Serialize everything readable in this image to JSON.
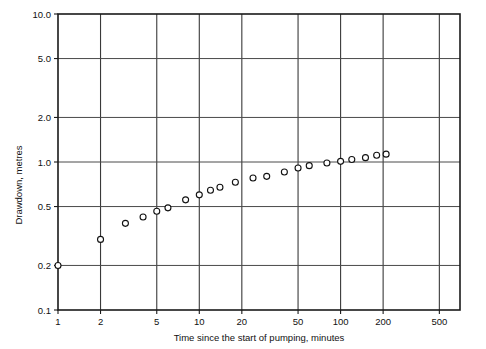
{
  "chart_data": {
    "type": "scatter",
    "title": "",
    "xlabel": "Time since the start of pumping, minutes",
    "ylabel": "Drawdown, metres",
    "xscale": "log",
    "yscale": "log",
    "xlim": [
      1,
      700
    ],
    "ylim": [
      0.1,
      10.0
    ],
    "grid": true,
    "legend": null,
    "xticks": [
      1,
      2,
      5,
      10,
      20,
      50,
      100,
      200,
      500
    ],
    "xtick_labels": [
      "1",
      "2",
      "5",
      "10",
      "20",
      "50",
      "100",
      "200",
      "500"
    ],
    "yticks": [
      0.1,
      0.2,
      0.5,
      1.0,
      2.0,
      5.0,
      10.0
    ],
    "ytick_labels": [
      "0.1",
      "0.5",
      "1.0",
      "2.0",
      "5.0",
      "0.2",
      "10.0"
    ],
    "ytick_labels_ordered": [
      "10.0",
      "5.0",
      "2.0",
      "1.0",
      "0.5",
      "0.2",
      "0.1"
    ],
    "series": [
      {
        "name": "Drawdown observations",
        "marker": "open-circle",
        "x": [
          1.0,
          2.0,
          3.0,
          4.0,
          5.0,
          6.0,
          8.0,
          10.0,
          12.0,
          14.0,
          18.0,
          24.0,
          30.0,
          40.0,
          50.0,
          60.0,
          80.0,
          100.0,
          120.0,
          150.0,
          180.0,
          210.0
        ],
        "y": [
          0.2,
          0.3,
          0.385,
          0.425,
          0.465,
          0.49,
          0.555,
          0.6,
          0.645,
          0.675,
          0.73,
          0.78,
          0.8,
          0.855,
          0.91,
          0.945,
          0.985,
          1.01,
          1.04,
          1.07,
          1.11,
          1.13
        ]
      }
    ]
  },
  "axis": {
    "ylabel": "Drawdown, metres",
    "xlabel": "Time since the start of pumping, minutes"
  }
}
